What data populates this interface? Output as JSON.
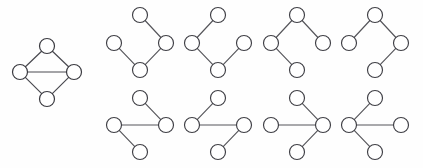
{
  "figure": {
    "title": "",
    "background_color": "#fefefe",
    "node_fill_color": "#ffffff",
    "node_stroke_color": "#3f3f45",
    "edge_color": "#55555a",
    "node_radius": 7.5
  },
  "main_graph": {
    "name": "diamond-graph",
    "node_count": 4,
    "edge_count": 5,
    "nodes": [
      {
        "id": "top",
        "label": "",
        "cx": 47,
        "cy": 46
      },
      {
        "id": "left",
        "label": "",
        "cx": 20,
        "cy": 72
      },
      {
        "id": "right",
        "label": "",
        "cx": 74,
        "cy": 72
      },
      {
        "id": "bottom",
        "label": "",
        "cx": 47,
        "cy": 99
      }
    ],
    "edges": [
      {
        "from": "top",
        "to": "left"
      },
      {
        "from": "top",
        "to": "right"
      },
      {
        "from": "left",
        "to": "right"
      },
      {
        "from": "left",
        "to": "bottom"
      },
      {
        "from": "right",
        "to": "bottom"
      }
    ]
  },
  "subgraphs": [
    {
      "name": "subgraph-1",
      "row": 0,
      "col": 0,
      "node_count": 4,
      "edge_count": 3,
      "nodes": [
        {
          "id": "top",
          "label": "",
          "cx": 140,
          "cy": 15
        },
        {
          "id": "left",
          "label": "",
          "cx": 114,
          "cy": 43
        },
        {
          "id": "right",
          "label": "",
          "cx": 166,
          "cy": 43
        },
        {
          "id": "bottom",
          "label": "",
          "cx": 140,
          "cy": 70
        }
      ],
      "edges": [
        {
          "from": "top",
          "to": "right"
        },
        {
          "from": "right",
          "to": "bottom"
        },
        {
          "from": "bottom",
          "to": "left"
        }
      ]
    },
    {
      "name": "subgraph-2",
      "row": 0,
      "col": 1,
      "node_count": 4,
      "edge_count": 3,
      "nodes": [
        {
          "id": "top",
          "label": "",
          "cx": 218,
          "cy": 15
        },
        {
          "id": "left",
          "label": "",
          "cx": 192,
          "cy": 43
        },
        {
          "id": "right",
          "label": "",
          "cx": 244,
          "cy": 43
        },
        {
          "id": "bottom",
          "label": "",
          "cx": 218,
          "cy": 70
        }
      ],
      "edges": [
        {
          "from": "top",
          "to": "left"
        },
        {
          "from": "left",
          "to": "bottom"
        },
        {
          "from": "bottom",
          "to": "right"
        }
      ]
    },
    {
      "name": "subgraph-3",
      "row": 0,
      "col": 2,
      "node_count": 4,
      "edge_count": 3,
      "nodes": [
        {
          "id": "top",
          "label": "",
          "cx": 297,
          "cy": 15
        },
        {
          "id": "left",
          "label": "",
          "cx": 271,
          "cy": 43
        },
        {
          "id": "right",
          "label": "",
          "cx": 323,
          "cy": 43
        },
        {
          "id": "bottom",
          "label": "",
          "cx": 297,
          "cy": 70
        }
      ],
      "edges": [
        {
          "from": "top",
          "to": "left"
        },
        {
          "from": "top",
          "to": "right"
        },
        {
          "from": "left",
          "to": "bottom"
        }
      ]
    },
    {
      "name": "subgraph-4",
      "row": 0,
      "col": 3,
      "node_count": 4,
      "edge_count": 3,
      "nodes": [
        {
          "id": "top",
          "label": "",
          "cx": 375,
          "cy": 15
        },
        {
          "id": "left",
          "label": "",
          "cx": 349,
          "cy": 43
        },
        {
          "id": "right",
          "label": "",
          "cx": 401,
          "cy": 43
        },
        {
          "id": "bottom",
          "label": "",
          "cx": 375,
          "cy": 70
        }
      ],
      "edges": [
        {
          "from": "top",
          "to": "left"
        },
        {
          "from": "top",
          "to": "right"
        },
        {
          "from": "right",
          "to": "bottom"
        }
      ]
    },
    {
      "name": "subgraph-5",
      "row": 1,
      "col": 0,
      "node_count": 4,
      "edge_count": 3,
      "nodes": [
        {
          "id": "top",
          "label": "",
          "cx": 140,
          "cy": 98
        },
        {
          "id": "left",
          "label": "",
          "cx": 114,
          "cy": 125
        },
        {
          "id": "right",
          "label": "",
          "cx": 166,
          "cy": 125
        },
        {
          "id": "bottom",
          "label": "",
          "cx": 140,
          "cy": 152
        }
      ],
      "edges": [
        {
          "from": "top",
          "to": "right"
        },
        {
          "from": "right",
          "to": "left"
        },
        {
          "from": "left",
          "to": "bottom"
        }
      ]
    },
    {
      "name": "subgraph-6",
      "row": 1,
      "col": 1,
      "node_count": 4,
      "edge_count": 3,
      "nodes": [
        {
          "id": "top",
          "label": "",
          "cx": 218,
          "cy": 98
        },
        {
          "id": "left",
          "label": "",
          "cx": 192,
          "cy": 125
        },
        {
          "id": "right",
          "label": "",
          "cx": 244,
          "cy": 125
        },
        {
          "id": "bottom",
          "label": "",
          "cx": 218,
          "cy": 152
        }
      ],
      "edges": [
        {
          "from": "top",
          "to": "left"
        },
        {
          "from": "left",
          "to": "right"
        },
        {
          "from": "right",
          "to": "bottom"
        }
      ]
    },
    {
      "name": "subgraph-7",
      "row": 1,
      "col": 2,
      "node_count": 4,
      "edge_count": 3,
      "nodes": [
        {
          "id": "top",
          "label": "",
          "cx": 297,
          "cy": 98
        },
        {
          "id": "left",
          "label": "",
          "cx": 271,
          "cy": 125
        },
        {
          "id": "right",
          "label": "",
          "cx": 323,
          "cy": 125
        },
        {
          "id": "bottom",
          "label": "",
          "cx": 297,
          "cy": 152
        }
      ],
      "edges": [
        {
          "from": "right",
          "to": "top"
        },
        {
          "from": "right",
          "to": "left"
        },
        {
          "from": "right",
          "to": "bottom"
        }
      ]
    },
    {
      "name": "subgraph-8",
      "row": 1,
      "col": 3,
      "node_count": 4,
      "edge_count": 3,
      "nodes": [
        {
          "id": "top",
          "label": "",
          "cx": 375,
          "cy": 98
        },
        {
          "id": "left",
          "label": "",
          "cx": 349,
          "cy": 125
        },
        {
          "id": "right",
          "label": "",
          "cx": 401,
          "cy": 125
        },
        {
          "id": "bottom",
          "label": "",
          "cx": 375,
          "cy": 152
        }
      ],
      "edges": [
        {
          "from": "left",
          "to": "top"
        },
        {
          "from": "left",
          "to": "right"
        },
        {
          "from": "left",
          "to": "bottom"
        }
      ]
    }
  ]
}
